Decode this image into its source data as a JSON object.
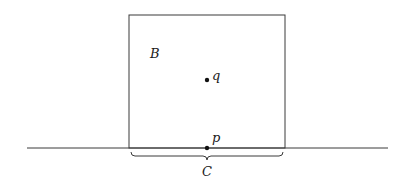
{
  "diagram": {
    "type": "geometric-figure",
    "width": 408,
    "height": 186,
    "colors": {
      "stroke": "#3a3a3a",
      "point": "#111111",
      "text": "#1a1a1a",
      "background": "#ffffff"
    },
    "line": {
      "label": "",
      "x1": 27,
      "y1": 148,
      "x2": 388,
      "y2": 148
    },
    "box": {
      "label": "B",
      "x": 129,
      "y": 15,
      "width": 156,
      "height": 133,
      "label_x": 150,
      "label_y": 58
    },
    "points": [
      {
        "id": "q",
        "label": "q",
        "x": 207,
        "y": 80,
        "label_x": 212,
        "label_y": 80
      },
      {
        "id": "p",
        "label": "p",
        "x": 207,
        "y": 148,
        "label_x": 212,
        "label_y": 142
      }
    ],
    "brace": {
      "label": "C",
      "x_start": 131,
      "x_end": 283,
      "y_top": 152,
      "depth": 8,
      "label_x": 202,
      "label_y": 176
    }
  }
}
